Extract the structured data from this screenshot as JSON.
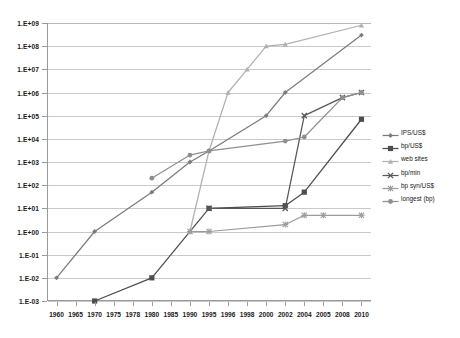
{
  "chart_data": {
    "type": "line",
    "title": "",
    "subtitle": "",
    "xlabel": "",
    "ylabel": "",
    "scale": "log",
    "grid": true,
    "legend_position": "right",
    "ylim": [
      0.001,
      1000000000
    ],
    "ytick_labels": [
      "1.E+09",
      "1.E+08",
      "1.E+07",
      "1.E+06",
      "1.E+05",
      "1.E+04",
      "1.E+03",
      "1.E+02",
      "1.E+01",
      "1.E+00",
      "1.E-01",
      "1.E-02",
      "1.E-03"
    ],
    "ytick_values": [
      1000000000.0,
      100000000.0,
      10000000.0,
      1000000.0,
      100000.0,
      10000.0,
      1000.0,
      100.0,
      10.0,
      1.0,
      0.1,
      0.01,
      0.001
    ],
    "categories": [
      "1960",
      "1965",
      "1970",
      "1975",
      "1978",
      "1980",
      "1985",
      "1990",
      "1995",
      "1996",
      "1998",
      "2000",
      "2002",
      "2004",
      "2005",
      "2008",
      "2010"
    ],
    "series": [
      {
        "name": "IPS/US$",
        "color": "#7b7b7b",
        "marker": "diamond",
        "values": [
          0.01,
          null,
          1,
          null,
          null,
          50,
          null,
          1000,
          3000,
          null,
          null,
          100000,
          1000000,
          null,
          null,
          null,
          300000000
        ]
      },
      {
        "name": "bp/US$",
        "color": "#4d4d4d",
        "marker": "square",
        "values": [
          null,
          null,
          0.001,
          null,
          null,
          0.01,
          null,
          null,
          10,
          null,
          null,
          null,
          13,
          50,
          null,
          null,
          70000
        ]
      },
      {
        "name": "web sites",
        "color": "#b0b0b0",
        "marker": "triangle",
        "values": [
          null,
          null,
          null,
          null,
          null,
          null,
          null,
          1,
          3000,
          1000000,
          10000000,
          100000000,
          120000000,
          null,
          null,
          null,
          800000000
        ]
      },
      {
        "name": "bp/min",
        "color": "#585858",
        "marker": "x",
        "values": [
          null,
          null,
          null,
          null,
          null,
          null,
          null,
          null,
          10,
          null,
          null,
          null,
          10,
          100000,
          null,
          600000,
          1000000
        ]
      },
      {
        "name": "bp syn/US$",
        "color": "#9b9b9b",
        "marker": "star",
        "values": [
          null,
          null,
          null,
          null,
          null,
          null,
          null,
          1,
          1,
          null,
          null,
          null,
          2,
          5,
          5,
          null,
          5
        ]
      },
      {
        "name": "longest (bp)",
        "color": "#8f8f8f",
        "marker": "circle",
        "values": [
          null,
          null,
          null,
          null,
          null,
          200,
          null,
          2000,
          3000,
          null,
          null,
          null,
          8000,
          12000,
          null,
          600000,
          1000000
        ]
      }
    ]
  }
}
